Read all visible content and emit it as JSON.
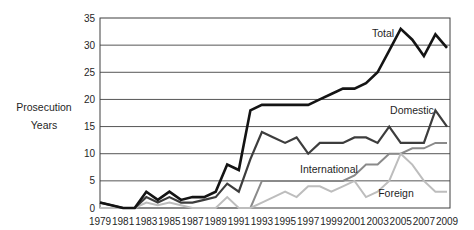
{
  "chart_data": {
    "type": "line",
    "title": "",
    "ylabel_lines": [
      "Prosecution",
      "Years"
    ],
    "xlabel": "",
    "x": [
      1979,
      1980,
      1981,
      1982,
      1983,
      1984,
      1985,
      1986,
      1987,
      1988,
      1989,
      1990,
      1991,
      1992,
      1993,
      1994,
      1995,
      1996,
      1997,
      1998,
      1999,
      2000,
      2001,
      2002,
      2003,
      2004,
      2005,
      2006,
      2007,
      2008,
      2009
    ],
    "x_tick_labels": [
      "1979",
      "1981",
      "1983",
      "1985",
      "1987",
      "1989",
      "1991",
      "1993",
      "1995",
      "1997",
      "1999",
      "2001",
      "2003",
      "2005",
      "2007",
      "2009"
    ],
    "y_ticks": [
      0,
      5,
      10,
      15,
      20,
      25,
      30,
      35
    ],
    "xlim": [
      1979,
      2009
    ],
    "ylim": [
      0,
      35
    ],
    "grid": "horizontal",
    "legend_position": "inline-annotations",
    "series": [
      {
        "name": "Total",
        "color": "#141414",
        "line_width": 2.6,
        "values": [
          1,
          0.5,
          0,
          0,
          3,
          1.5,
          3,
          1.5,
          2,
          2,
          3,
          8,
          7,
          18,
          19,
          19,
          19,
          19,
          19,
          20,
          21,
          22,
          22,
          23,
          25,
          29,
          33,
          31,
          28,
          32,
          29.5
        ]
      },
      {
        "name": "Domestic",
        "color": "#3d3d3d",
        "line_width": 2.2,
        "values": [
          1,
          0.5,
          0,
          0,
          2,
          1,
          2,
          1,
          1,
          1.5,
          2,
          4.5,
          3,
          9,
          14,
          13,
          12,
          13,
          10,
          12,
          12,
          12,
          13,
          13,
          12,
          15,
          12,
          12,
          12,
          18,
          15
        ]
      },
      {
        "name": "International",
        "color": "#8a8a8a",
        "line_width": 2,
        "values": [
          0,
          0,
          0,
          0,
          0,
          0,
          0,
          0,
          0,
          0,
          0,
          0,
          0,
          0,
          5,
          5,
          5,
          5,
          5,
          5,
          5,
          5,
          6,
          8,
          8,
          10,
          10,
          11,
          11,
          12,
          12
        ]
      },
      {
        "name": "Foreign",
        "color": "#bdbdbd",
        "line_width": 2,
        "values": [
          0,
          0,
          0,
          0,
          1,
          0.5,
          1,
          0.5,
          0,
          0,
          0,
          2,
          0,
          0,
          1,
          2,
          3,
          2,
          4,
          4,
          3,
          4,
          5,
          2,
          3,
          5,
          10,
          8,
          5,
          3,
          3
        ]
      }
    ]
  }
}
